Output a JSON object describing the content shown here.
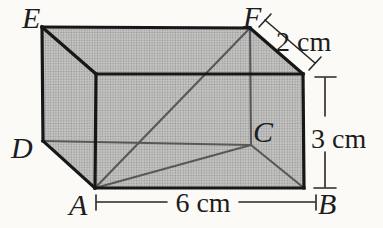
{
  "figure": {
    "shape": "rectangular-prism",
    "vertex_labels": {
      "E": "E",
      "F": "F",
      "D": "D",
      "C": "C",
      "A": "A",
      "B": "B"
    },
    "dimensions": {
      "depth_label": "2 cm",
      "height_label": "3 cm",
      "width_label": "6 cm"
    },
    "colors": {
      "background": "#fbfaf7",
      "face_fill": "#b6b6b3",
      "halftone_base": "#c6c6c3",
      "halftone_dot": "#97979a",
      "edge": "#171717",
      "hidden_line": "#585858",
      "dimension": "#262626",
      "text": "#1c1c1c"
    }
  }
}
